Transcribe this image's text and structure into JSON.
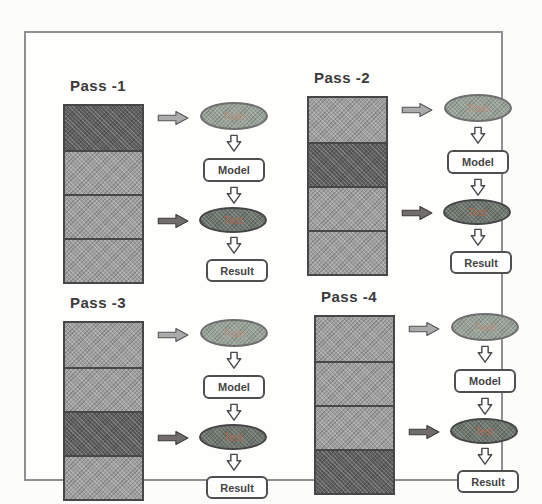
{
  "figure": {
    "passes_count": 4
  },
  "colors": {
    "frame-border": "#8f8f8f",
    "title-text": "#3b3b3b",
    "fold-light": "#a0a0a0",
    "fold-dark": "#5f5f5f",
    "fold-border": "#474747",
    "train-fill": "#99a399",
    "train-border": "#6e6e6e",
    "train-text": "#b98f7c",
    "test-fill": "#6e766e",
    "test-border": "#454545",
    "test-text": "#b06a52",
    "box-border": "#4f4f4f",
    "box-text": "#454545",
    "arrow-train-fill": "#ababab",
    "arrow-train-stroke": "#565656",
    "arrow-test-fill": "#716d6a",
    "arrow-test-stroke": "#3d3d3d",
    "down-arrow-fill": "#ffffff",
    "down-arrow-stroke": "#4a4a4a"
  },
  "flow": {
    "train_label": "Train",
    "model_label": "Model",
    "test_label": "Test",
    "result_label": "Result"
  },
  "passes": [
    {
      "title": "Pass -1",
      "folds": [
        "test",
        "train",
        "train",
        "train"
      ]
    },
    {
      "title": "Pass -2",
      "folds": [
        "train",
        "test",
        "train",
        "train"
      ]
    },
    {
      "title": "Pass -3",
      "folds": [
        "train",
        "train",
        "test",
        "train"
      ]
    },
    {
      "title": "Pass -4",
      "folds": [
        "train",
        "train",
        "train",
        "test"
      ]
    }
  ]
}
